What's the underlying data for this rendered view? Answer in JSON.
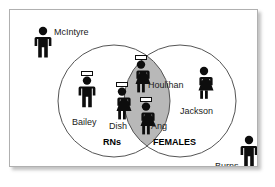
{
  "diagram": {
    "sets": [
      {
        "id": "rns",
        "label": "RNs"
      },
      {
        "id": "females",
        "label": "FEMALES"
      }
    ],
    "colors": {
      "frame_border": "#b0b0b0",
      "circle_stroke": "#4d4d4d",
      "intersection_fill": "#b8b8b8",
      "figure_fill": "#0d0d0d",
      "cap_fill": "#ffffff",
      "background": "#ffffff",
      "text": "#1a1a1a"
    },
    "people": [
      {
        "name": "McIntyre",
        "region": "outside",
        "icon": "male-figure-icon",
        "has_cap": false,
        "is_female": false,
        "x": 22,
        "y": 16,
        "label_x": 44,
        "label_y": 18
      },
      {
        "name": "Bailey",
        "region": "rns-only",
        "icon": "nurse-male-figure-icon",
        "has_cap": true,
        "is_female": false,
        "x": 66,
        "y": 61,
        "label_x": 62,
        "label_y": 108
      },
      {
        "name": "Houlihan",
        "region": "intersection",
        "icon": "nurse-female-figure-icon",
        "has_cap": true,
        "is_female": true,
        "x": 119,
        "y": 45,
        "label_x": 138,
        "label_y": 71
      },
      {
        "name": "Dish",
        "region": "intersection",
        "icon": "nurse-female-figure-icon",
        "has_cap": true,
        "is_female": true,
        "x": 100,
        "y": 72,
        "label_x": 99,
        "label_y": 112
      },
      {
        "name": "Ang",
        "region": "intersection",
        "icon": "nurse-female-figure-icon",
        "has_cap": true,
        "is_female": true,
        "x": 124,
        "y": 87,
        "label_x": 141,
        "label_y": 112
      },
      {
        "name": "Jackson",
        "region": "females-only",
        "icon": "female-figure-icon",
        "has_cap": false,
        "is_female": true,
        "x": 182,
        "y": 56,
        "label_x": 170,
        "label_y": 97
      },
      {
        "name": "Burns",
        "region": "outside",
        "icon": "male-figure-icon",
        "has_cap": false,
        "is_female": false,
        "x": 228,
        "y": 125,
        "label_x": 205,
        "label_y": 152
      }
    ],
    "set_labels": [
      {
        "text": "RNs",
        "x": 93,
        "y": 128
      },
      {
        "text": "FEMALES",
        "x": 143,
        "y": 128
      }
    ],
    "geometry": {
      "left_circle": {
        "cx": 104,
        "cy": 91,
        "r": 56
      },
      "right_circle": {
        "cx": 170,
        "cy": 91,
        "r": 56
      }
    }
  }
}
